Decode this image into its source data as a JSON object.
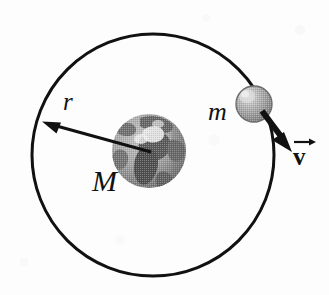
{
  "figure": {
    "kind": "physics-orbit-diagram",
    "caption": "",
    "background_color": "#fdfdfd",
    "stroke_color": "#111111",
    "width": 329,
    "height": 295
  },
  "labels": {
    "central_mass": "M",
    "orbiting_mass": "m",
    "radius": "r",
    "velocity": "v"
  },
  "orbit": {
    "name": "orbit-circle",
    "center_x": 153,
    "center_y": 155,
    "radius": 121,
    "stroke_width": 3,
    "stroke_color": "#111111",
    "fill": "none"
  },
  "central_body": {
    "name": "earth-globe",
    "center_x": 149,
    "center_y": 151,
    "radius": 37,
    "ocean_color": "#a8a8a8",
    "land_color": "#5e5e5e",
    "highlight_color": "#f0f0f0",
    "shadow_color": "#7a7a7a"
  },
  "orbiting_body": {
    "name": "satellite-sphere",
    "center_x": 254,
    "center_y": 104,
    "radius": 18,
    "base_color": "#a5a5a5",
    "highlight_color": "#d8d8d8",
    "edge_color": "#6d6d6d"
  },
  "radius_arrow": {
    "name": "radius-vector-arrow",
    "from_x": 151,
    "from_y": 152,
    "to_x": 43,
    "to_y": 122,
    "stroke_width": 3,
    "head_length": 17,
    "head_width": 13
  },
  "velocity_arrow": {
    "name": "velocity-vector-arrow",
    "from_x": 262,
    "from_y": 112,
    "to_x": 292,
    "to_y": 152,
    "stroke_width": 6,
    "head_length": 18,
    "head_width": 17
  }
}
